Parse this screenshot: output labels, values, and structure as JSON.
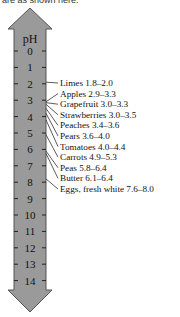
{
  "caption": "are as shown here.",
  "scale": {
    "title": "pH",
    "ticks": [
      "0",
      "1",
      "2",
      "3",
      "4",
      "5",
      "6",
      "7",
      "8",
      "9",
      "10",
      "11",
      "12",
      "13",
      "14"
    ],
    "bar_color": "#9a9a9a",
    "outline_color": "#555555"
  },
  "items": [
    {
      "name": "Limes",
      "range": "1.8–2.0",
      "low": 1.8,
      "high": 2.0
    },
    {
      "name": "Apples",
      "range": "2.9–3.3",
      "low": 2.9,
      "high": 3.3
    },
    {
      "name": "Grapefruit",
      "range": "3.0–3.3",
      "low": 3.0,
      "high": 3.3
    },
    {
      "name": "Strawberries",
      "range": "3.0–3.5",
      "low": 3.0,
      "high": 3.5
    },
    {
      "name": "Peaches",
      "range": "3.4–3.6",
      "low": 3.4,
      "high": 3.6
    },
    {
      "name": "Pears",
      "range": "3.6–4.0",
      "low": 3.6,
      "high": 4.0
    },
    {
      "name": "Tomatoes",
      "range": "4.0–4.4",
      "low": 4.0,
      "high": 4.4
    },
    {
      "name": "Carrots",
      "range": "4.9–5.3",
      "low": 4.9,
      "high": 5.3
    },
    {
      "name": "Peas",
      "range": "5.8–6.4",
      "low": 5.8,
      "high": 6.4
    },
    {
      "name": "Butter",
      "range": "6.1–6.4",
      "low": 6.1,
      "high": 6.4
    },
    {
      "name": "Eggs, fresh white",
      "range": "7.6–8.0",
      "low": 7.6,
      "high": 8.0
    }
  ]
}
